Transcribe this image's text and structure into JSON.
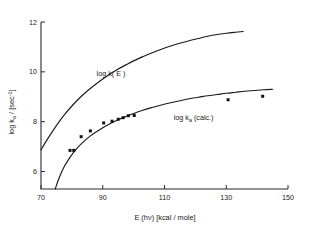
{
  "chart_data": {
    "type": "line",
    "title": "",
    "xlabel": "E (hν) [kcal / mole]",
    "ylabel": "log kₐ / [sec⁻¹]",
    "xlim": [
      70,
      150
    ],
    "ylim": [
      5.3,
      12
    ],
    "grid": false,
    "legend_position": "inline-annotations",
    "xticks": [
      70,
      90,
      110,
      130,
      150
    ],
    "xtick_labels": [
      "70",
      "90",
      "110",
      "130",
      "150"
    ],
    "yticks": [
      6,
      8,
      10,
      12
    ],
    "ytick_labels": [
      "6",
      "8",
      "10",
      "12"
    ],
    "annotations": [
      {
        "text": "log  k( E )",
        "x": 88,
        "y": 9.85
      },
      {
        "text": "log kₐ (calc.)",
        "x": 113,
        "y": 8.05
      }
    ],
    "series": [
      {
        "name": "log k(E)",
        "type": "line",
        "points": [
          [
            70.0,
            6.87
          ],
          [
            72.0,
            7.28
          ],
          [
            74.0,
            7.66
          ],
          [
            76.0,
            8.02
          ],
          [
            78.0,
            8.34
          ],
          [
            80.0,
            8.63
          ],
          [
            82.5,
            8.95
          ],
          [
            85.0,
            9.23
          ],
          [
            87.5,
            9.48
          ],
          [
            90.0,
            9.71
          ],
          [
            92.5,
            9.92
          ],
          [
            95.0,
            10.11
          ],
          [
            97.5,
            10.28
          ],
          [
            100.0,
            10.44
          ],
          [
            103.0,
            10.61
          ],
          [
            106.0,
            10.77
          ],
          [
            109.0,
            10.91
          ],
          [
            112.0,
            11.04
          ],
          [
            115.0,
            11.15
          ],
          [
            118.0,
            11.25
          ],
          [
            121.0,
            11.34
          ],
          [
            124.0,
            11.43
          ],
          [
            127.0,
            11.5
          ],
          [
            130.0,
            11.55
          ],
          [
            133.0,
            11.59
          ],
          [
            135.5,
            11.62
          ]
        ]
      },
      {
        "name": "log kₐ (calc.)",
        "type": "line",
        "points": [
          [
            74.6,
            5.3
          ],
          [
            75.5,
            5.62
          ],
          [
            76.5,
            5.93
          ],
          [
            77.5,
            6.19
          ],
          [
            79.0,
            6.5
          ],
          [
            80.5,
            6.76
          ],
          [
            82.0,
            6.98
          ],
          [
            84.0,
            7.22
          ],
          [
            86.0,
            7.43
          ],
          [
            88.0,
            7.6
          ],
          [
            90.0,
            7.76
          ],
          [
            92.5,
            7.93
          ],
          [
            95.0,
            8.08
          ],
          [
            97.5,
            8.21
          ],
          [
            100.0,
            8.33
          ],
          [
            103.0,
            8.46
          ],
          [
            106.0,
            8.57
          ],
          [
            109.0,
            8.67
          ],
          [
            112.0,
            8.76
          ],
          [
            115.0,
            8.84
          ],
          [
            118.0,
            8.92
          ],
          [
            121.0,
            8.98
          ],
          [
            124.0,
            9.04
          ],
          [
            127.0,
            9.09
          ],
          [
            130.0,
            9.14
          ],
          [
            133.0,
            9.18
          ],
          [
            136.0,
            9.22
          ],
          [
            139.0,
            9.25
          ],
          [
            142.0,
            9.28
          ],
          [
            145.0,
            9.3
          ]
        ]
      },
      {
        "name": "measured points",
        "type": "scatter",
        "points": [
          [
            79.4,
            6.85
          ],
          [
            80.6,
            6.85
          ],
          [
            83.0,
            7.4
          ],
          [
            86.0,
            7.63
          ],
          [
            90.3,
            7.95
          ],
          [
            93.0,
            8.02
          ],
          [
            95.0,
            8.1
          ],
          [
            96.6,
            8.16
          ],
          [
            98.3,
            8.24
          ],
          [
            100.2,
            8.25
          ],
          [
            130.6,
            8.88
          ],
          [
            141.8,
            9.02
          ]
        ]
      }
    ]
  }
}
